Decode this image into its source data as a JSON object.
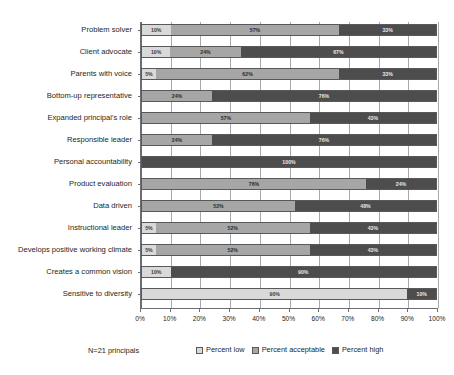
{
  "chart_data": {
    "type": "bar",
    "orientation": "horizontal",
    "stacked": true,
    "stack_mode": "percent",
    "title": "",
    "subtitle": "",
    "xlabel": "",
    "ylabel": "",
    "xlim": [
      0,
      100
    ],
    "grid": true,
    "legend_position": "bottom-right",
    "note": "N=21 principals",
    "xticks": [
      "0%",
      "10%",
      "20%",
      "30%",
      "40%",
      "50%",
      "60%",
      "70%",
      "80%",
      "90%",
      "100%"
    ],
    "xtick_values": [
      0,
      10,
      20,
      30,
      40,
      50,
      60,
      70,
      80,
      90,
      100
    ],
    "categories": [
      "Problem solver",
      "Client advocate",
      "Parents with voice",
      "Bottom-up representative",
      "Expanded principal's role",
      "Responsible leader",
      "Personal accountability",
      "Product evaluation",
      "Data driven",
      "Instructional leader",
      "Develops positive working climate",
      "Creates a common vision",
      "Sensitive to diversity"
    ],
    "series": [
      {
        "name": "Percent low",
        "color": "#d9d9d9",
        "values": [
          10,
          10,
          5,
          0,
          0,
          0,
          0,
          0,
          0,
          5,
          5,
          10,
          90
        ]
      },
      {
        "name": "Percent acceptable",
        "color": "#a6a6a6",
        "values": [
          57,
          24,
          62,
          24,
          57,
          24,
          0,
          76,
          52,
          52,
          52,
          0,
          0
        ]
      },
      {
        "name": "Percent high",
        "color": "#4d4d4d",
        "values": [
          33,
          67,
          33,
          76,
          43,
          76,
          100,
          24,
          48,
          43,
          43,
          90,
          10
        ]
      }
    ],
    "bar_labels": [
      [
        "10%",
        "57%",
        "33%"
      ],
      [
        "10%",
        "24%",
        "67%"
      ],
      [
        "5%",
        "62%",
        "33%"
      ],
      [
        "",
        "24%",
        "76%"
      ],
      [
        "",
        "57%",
        "43%"
      ],
      [
        "",
        "24%",
        "76%"
      ],
      [
        "",
        "",
        "100%"
      ],
      [
        "",
        "76%",
        "24%"
      ],
      [
        "",
        "52%",
        "48%"
      ],
      [
        "5%",
        "52%",
        "43%"
      ],
      [
        "5%",
        "52%",
        "43%"
      ],
      [
        "10%",
        "",
        "90%"
      ],
      [
        "90%",
        "",
        "10%"
      ]
    ]
  },
  "legend": {
    "note": "N=21 principals",
    "items": [
      {
        "label": "Percent low",
        "color": "#d9d9d9"
      },
      {
        "label": "Percent acceptable",
        "color": "#a6a6a6"
      },
      {
        "label": "Percent high",
        "color": "#4d4d4d"
      }
    ]
  }
}
